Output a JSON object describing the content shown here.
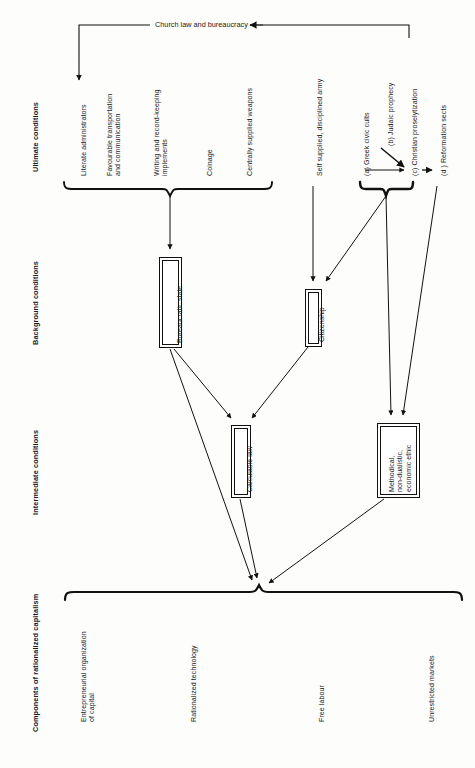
{
  "diagram": {
    "title": "Church law and bureaucracy",
    "orientation": "rotated-90-ccw",
    "category_labels": [
      {
        "id": "ultimate",
        "text": "Ultimate conditions"
      },
      {
        "id": "background",
        "text": "Background conditions"
      },
      {
        "id": "intermediate",
        "text": "Intermediate conditions"
      },
      {
        "id": "components",
        "text": "Components of rationalized capitalism"
      }
    ],
    "top_banner": {
      "label": "Church law and bureaucracy",
      "arrow_direction": "left"
    },
    "ultimate_conditions": {
      "group_a": {
        "brace": true,
        "items": [
          "Literate administrators",
          "Favourable transportation\nand communication",
          "Writing and record-keeping\nimplements",
          "Coinage",
          "Centrally supplied weapons"
        ]
      },
      "standalone": [
        "Self supplied, disciplined army"
      ],
      "group_b": {
        "brace": true,
        "items": [
          "(a) Greek civic cults",
          "(b) Judaic prophecy",
          "(c) Christian proselytization"
        ]
      },
      "standalone_right": [
        "(d ) Reformation sects"
      ]
    },
    "background_conditions": {
      "boxes": [
        {
          "id": "bureaucratic-state",
          "label": "Bureaucratic state"
        },
        {
          "id": "citizenship",
          "label": "Citizenship"
        }
      ]
    },
    "intermediate_conditions": {
      "boxes": [
        {
          "id": "calculable-law",
          "label": "Calculable law"
        },
        {
          "id": "economic-ethic",
          "label": "Methodical,\nnon-dualistic,\neconomic ethic"
        }
      ]
    },
    "components_of_capitalism": {
      "brace": true,
      "items": [
        "Entrepreneurial organization\nof capital",
        "Rationalized technology",
        "Free labour",
        "Unrestricted markets"
      ]
    },
    "colors": {
      "ink": "#111111",
      "background": "#fdfdfb",
      "text": "#1a1a1a"
    }
  }
}
